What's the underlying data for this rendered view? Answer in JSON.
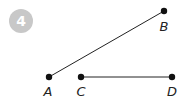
{
  "problem": {
    "number": "4",
    "badge_color": "#c8c8c8"
  },
  "diagram": {
    "line_color": "#222222",
    "points": [
      {
        "label": "A",
        "x": 49,
        "y": 77,
        "label_x": 48,
        "label_y": 96
      },
      {
        "label": "B",
        "x": 164,
        "y": 11,
        "label_x": 164,
        "label_y": 31
      },
      {
        "label": "C",
        "x": 81,
        "y": 77,
        "label_x": 81,
        "label_y": 96
      },
      {
        "label": "D",
        "x": 172,
        "y": 77,
        "label_x": 172,
        "label_y": 96
      }
    ],
    "segments": [
      {
        "name": "AB",
        "from": "A",
        "to": "B"
      },
      {
        "name": "CD",
        "from": "C",
        "to": "D"
      }
    ]
  }
}
